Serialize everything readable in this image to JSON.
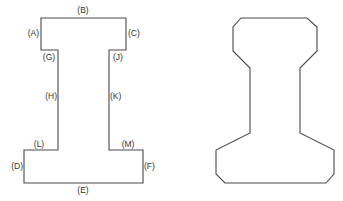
{
  "diagram": {
    "type": "cross-section comparison",
    "stroke_color": "#4a4a4a",
    "label_color": "#333333",
    "left_shape": {
      "name": "simplified I-section with labeled edges",
      "labels": {
        "A": "(A)",
        "B": "(B)",
        "C": "(C)",
        "D": "(D)",
        "E": "(E)",
        "F": "(F)",
        "G": "(G)",
        "H": "(H)",
        "J": "(J)",
        "K": "(K)",
        "L": "(L)",
        "M": "(M)"
      },
      "points": "41,18 126,18 126,50 109,50 109,150 143,150 143,183 24,183 24,150 58,150 58,50 41,50"
    },
    "right_shape": {
      "name": "chamfered rail-like profile",
      "points": "241,18 307,18 317,27 317,51 300,68 300,133 334,150 334,174 326,183 225,183 216,174 216,150 250,133 250,68 233,51 233,27"
    }
  }
}
